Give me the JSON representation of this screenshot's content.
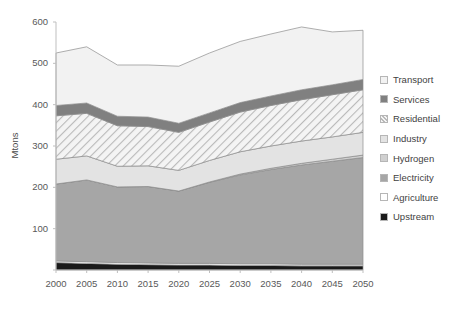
{
  "chart_data": {
    "type": "area",
    "stacked": true,
    "title": "",
    "xlabel": "",
    "ylabel": "Mtons",
    "ylim": [
      0,
      600
    ],
    "yticks": [
      0,
      100,
      200,
      300,
      400,
      500,
      600
    ],
    "ytick_labels": [
      "",
      "100",
      "200",
      "300",
      "400",
      "500",
      "600"
    ],
    "grid": false,
    "legend_position": "right",
    "x": [
      2000,
      2005,
      2010,
      2015,
      2020,
      2025,
      2030,
      2035,
      2040,
      2045,
      2050
    ],
    "xtick_labels": [
      "2000",
      "2005",
      "2010",
      "2015",
      "2020",
      "2025",
      "2030",
      "2035",
      "2040",
      "2045",
      "2050"
    ],
    "stack_order_bottom_to_top": [
      "Upstream",
      "Agriculture",
      "Electricity",
      "Hydrogen",
      "Industry",
      "Residential",
      "Services",
      "Transport"
    ],
    "series": [
      {
        "name": "Upstream",
        "color": "#1a1a1a",
        "pattern": "solid",
        "values": [
          18,
          16,
          14,
          13,
          12,
          12,
          11,
          11,
          10,
          10,
          10
        ]
      },
      {
        "name": "Agriculture",
        "color": "#ffffff",
        "pattern": "solid",
        "values": [
          4,
          4,
          4,
          4,
          4,
          4,
          4,
          4,
          4,
          4,
          4
        ]
      },
      {
        "name": "Electricity",
        "color": "#a6a6a6",
        "pattern": "solid",
        "values": [
          186,
          198,
          183,
          185,
          175,
          196,
          215,
          228,
          240,
          249,
          258
        ]
      },
      {
        "name": "Hydrogen",
        "color": "#d0d0d0",
        "pattern": "solid",
        "values": [
          0,
          0,
          0,
          0,
          0,
          1,
          2,
          3,
          4,
          5,
          6
        ]
      },
      {
        "name": "Industry",
        "color": "#e3e3e3",
        "pattern": "solid",
        "values": [
          60,
          58,
          50,
          50,
          50,
          52,
          54,
          54,
          54,
          54,
          55
        ]
      },
      {
        "name": "Residential",
        "color": "#efefef",
        "pattern": "diagonal-hatch",
        "values": [
          105,
          103,
          98,
          95,
          92,
          93,
          96,
          98,
          100,
          102,
          103
        ]
      },
      {
        "name": "Services",
        "color": "#808080",
        "pattern": "solid",
        "values": [
          25,
          25,
          23,
          23,
          22,
          22,
          23,
          23,
          24,
          24,
          25
        ]
      },
      {
        "name": "Transport",
        "color": "#f2f2f2",
        "pattern": "solid",
        "values": [
          127,
          136,
          124,
          126,
          138,
          145,
          148,
          150,
          152,
          128,
          119
        ]
      }
    ],
    "totals": [
      525,
      540,
      496,
      496,
      493,
      525,
      553,
      571,
      588,
      576,
      580
    ],
    "legend_entries": [
      {
        "label": "Transport",
        "color": "#f2f2f2",
        "pattern": "solid"
      },
      {
        "label": "Services",
        "color": "#808080",
        "pattern": "solid"
      },
      {
        "label": "Residential",
        "color": "#efefef",
        "pattern": "diagonal-hatch"
      },
      {
        "label": "Industry",
        "color": "#e3e3e3",
        "pattern": "solid"
      },
      {
        "label": "Hydrogen",
        "color": "#d0d0d0",
        "pattern": "solid"
      },
      {
        "label": "Electricity",
        "color": "#a6a6a6",
        "pattern": "solid"
      },
      {
        "label": "Agriculture",
        "color": "#ffffff",
        "pattern": "solid"
      },
      {
        "label": "Upstream",
        "color": "#1a1a1a",
        "pattern": "solid"
      }
    ]
  }
}
